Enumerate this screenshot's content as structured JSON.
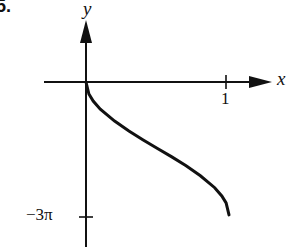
{
  "problem": {
    "number": "5."
  },
  "chart_data": {
    "type": "line",
    "title": "",
    "xlabel": "x",
    "ylabel": "y",
    "x_ticks": [
      {
        "value": 1,
        "label": "1"
      }
    ],
    "y_ticks": [
      {
        "value": -9.4248,
        "label": "−3π"
      }
    ],
    "xlim": [
      0,
      1
    ],
    "ylim": [
      -9.4248,
      0
    ],
    "grid": false,
    "legend": null,
    "series": [
      {
        "name": "curve",
        "description": "Decreasing curve from (0,0) to (1,-3π) with vertical tangents at both endpoints and an inflection near x=0.5, y=-1.5π",
        "x": [
          0,
          0.02,
          0.05,
          0.1,
          0.2,
          0.3,
          0.4,
          0.5,
          0.6,
          0.7,
          0.8,
          0.9,
          0.95,
          0.98,
          1
        ],
        "y": [
          0,
          -0.85,
          -1.35,
          -1.93,
          -2.77,
          -3.48,
          -4.11,
          -4.71,
          -5.31,
          -5.94,
          -6.65,
          -7.49,
          -8.07,
          -8.57,
          -9.42
        ]
      }
    ]
  },
  "labels": {
    "x_axis": "x",
    "y_axis": "y",
    "x_tick": "1",
    "y_tick": "−3π"
  }
}
